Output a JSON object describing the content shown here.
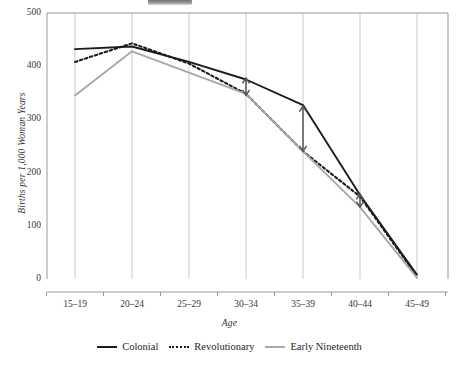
{
  "figure": {
    "top_artifact_name": "cropped-caption-fragment"
  },
  "axes": {
    "ylabel": "Births per 1,000 Woman Years",
    "xlabel": "Age",
    "yticks": [
      "0",
      "100",
      "200",
      "300",
      "400",
      "500"
    ],
    "xticks": [
      "15–19",
      "20–24",
      "25–29",
      "30–34",
      "35–39",
      "40–44",
      "45–49"
    ]
  },
  "legend": {
    "items": [
      {
        "label": "Colonial",
        "style": "solid-dark",
        "color": "#1c1c1c"
      },
      {
        "label": "Revolutionary",
        "style": "dotted-dark",
        "color": "#1c1c1c"
      },
      {
        "label": "Early Nineteenth",
        "style": "solid-gray",
        "color": "#a8a8a8"
      }
    ]
  },
  "colors": {
    "colonial": "#1c1c1c",
    "revolutionary": "#1c1c1c",
    "early_nineteenth": "#a8a8a8",
    "gridline": "#c9c9c9",
    "frame": "#9a9a9a",
    "annotation": "#555555"
  },
  "annotations": [
    {
      "name": "gap-arrow-30-34",
      "x_category": "30–34",
      "y_top": 378,
      "y_bottom": 345
    },
    {
      "name": "gap-arrow-35-39",
      "x_category": "35–39",
      "y_top": 325,
      "y_bottom": 240
    },
    {
      "name": "gap-arrow-40-44",
      "x_category": "40–44",
      "y_top": 160,
      "y_bottom": 135
    }
  ],
  "chart_data": {
    "type": "line",
    "title": "",
    "xlabel": "Age",
    "ylabel": "Births per 1,000 Woman Years",
    "categories": [
      "15–19",
      "20–24",
      "25–29",
      "30–34",
      "35–39",
      "40–44",
      "45–49"
    ],
    "series": [
      {
        "name": "Colonial",
        "style": "solid",
        "color": "#1c1c1c",
        "values": [
          432,
          437,
          408,
          375,
          327,
          158,
          8
        ]
      },
      {
        "name": "Revolutionary",
        "style": "dotted",
        "color": "#1c1c1c",
        "values": [
          408,
          443,
          405,
          348,
          240,
          155,
          5
        ]
      },
      {
        "name": "Early Nineteenth",
        "style": "solid",
        "color": "#a8a8a8",
        "values": [
          345,
          428,
          388,
          348,
          240,
          135,
          2
        ]
      }
    ],
    "ylim": [
      0,
      500
    ],
    "ytick_values": [
      0,
      100,
      200,
      300,
      400,
      500
    ],
    "grid": "vertical",
    "legend_position": "bottom"
  }
}
